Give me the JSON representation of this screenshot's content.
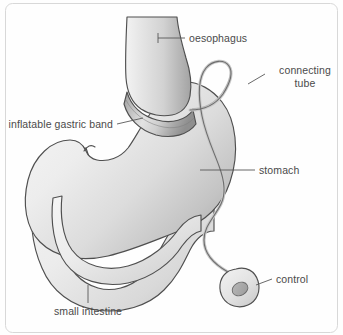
{
  "figure": {
    "background_color": "#fefefe",
    "outline_color": "#4f4f4f",
    "label_color": "#4a4a4a",
    "leader_color": "#585858",
    "tube_fill_color": "#c9c9c9",
    "band_color": "#9a9a9a"
  },
  "labels": {
    "oesophagus": "oesophagus",
    "connecting_tube_line1": "connecting",
    "connecting_tube_line2": "tube",
    "inflatable_gastric_band": "inflatable gastric band",
    "stomach": "stomach",
    "control": "control",
    "small_intestine": "small intestine"
  },
  "parts": [
    {
      "name": "oesophagus",
      "label": "oesophagus"
    },
    {
      "name": "connecting-tube",
      "label": "connecting tube"
    },
    {
      "name": "inflatable-gastric-band",
      "label": "inflatable gastric band"
    },
    {
      "name": "stomach",
      "label": "stomach"
    },
    {
      "name": "control",
      "label": "control"
    },
    {
      "name": "small-intestine",
      "label": "small intestine"
    }
  ]
}
